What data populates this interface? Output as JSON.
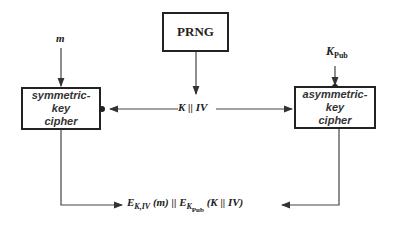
{
  "diagram": {
    "nodes": {
      "prng": {
        "label": "PRNG"
      },
      "symmetric": {
        "line1": "symmetric-key",
        "line2": "cipher"
      },
      "asymmetric": {
        "line1": "asymmetric-key",
        "line2": "cipher"
      }
    },
    "inputs": {
      "message": "m",
      "public_key": {
        "base": "K",
        "sub": "Pub"
      },
      "key_iv": "K || IV"
    },
    "output": {
      "e1": "E",
      "e1_sub": "K,IV",
      "e1_arg": "(m) || ",
      "e2": "E",
      "e2_sub_base": "K",
      "e2_sub_sub": "Pub",
      "e2_arg": "(K || IV)"
    },
    "edges": [
      {
        "from": "m",
        "to": "symmetric"
      },
      {
        "from": "prng",
        "to": "key_iv"
      },
      {
        "from": "key_iv",
        "to": "symmetric"
      },
      {
        "from": "key_iv",
        "to": "asymmetric"
      },
      {
        "from": "public_key",
        "to": "asymmetric"
      },
      {
        "from": "symmetric",
        "to": "output"
      },
      {
        "from": "asymmetric",
        "to": "output"
      }
    ]
  }
}
